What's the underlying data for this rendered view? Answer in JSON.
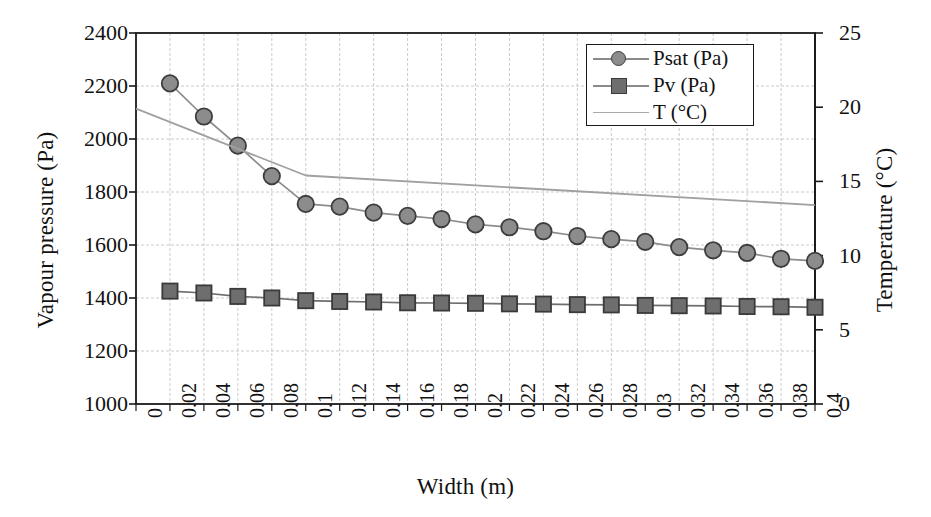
{
  "chart_data": {
    "type": "line",
    "title": "",
    "xlabel": "Width (m)",
    "ylabel": "Vapour pressure (Pa)",
    "y2label": "Temperature (°C)",
    "xlim": [
      0,
      0.4
    ],
    "ylim": [
      1000,
      2400
    ],
    "y2lim": [
      0,
      25
    ],
    "grid": true,
    "legend_position": "top-right",
    "categories": [
      0,
      0.02,
      0.04,
      0.06,
      0.08,
      0.1,
      0.12,
      0.14,
      0.16,
      0.18,
      0.2,
      0.22,
      0.24,
      0.26,
      0.28,
      0.3,
      0.32,
      0.34,
      0.36,
      0.38,
      0.4
    ],
    "xticklabels": [
      "0",
      "0.02",
      "0.04",
      "0.06",
      "0.08",
      "0.1",
      "0.12",
      "0.14",
      "0.16",
      "0.18",
      "0.2",
      "0.22",
      "0.24",
      "0.26",
      "0.28",
      "0.3",
      "0.32",
      "0.34",
      "0.36",
      "0.38",
      "0.4"
    ],
    "yticklabels": [
      "2400",
      "2200",
      "2000",
      "1800",
      "1600",
      "1400",
      "1200",
      "1000"
    ],
    "ytickvalues": [
      2400,
      2200,
      2000,
      1800,
      1600,
      1400,
      1200,
      1000
    ],
    "y2ticklabels": [
      "25",
      "20",
      "15",
      "10",
      "5",
      "0"
    ],
    "y2tickvalues": [
      25,
      20,
      15,
      10,
      5,
      0
    ],
    "series": [
      {
        "name": "Psat (Pa)",
        "axis": "left",
        "marker": "circle",
        "color": "#8c8c8c",
        "edge_color": "#3d3d3d",
        "x": [
          0.02,
          0.04,
          0.06,
          0.08,
          0.1,
          0.12,
          0.14,
          0.16,
          0.18,
          0.2,
          0.22,
          0.24,
          0.26,
          0.28,
          0.3,
          0.32,
          0.34,
          0.36,
          0.38,
          0.4
        ],
        "values": [
          2210,
          2085,
          1975,
          1860,
          1755,
          1745,
          1722,
          1710,
          1698,
          1678,
          1667,
          1652,
          1634,
          1622,
          1612,
          1592,
          1580,
          1570,
          1548,
          1540
        ]
      },
      {
        "name": "Pv (Pa)",
        "axis": "left",
        "marker": "square",
        "color": "#6e6e6e",
        "edge_color": "#3a3a3a",
        "x": [
          0.02,
          0.04,
          0.06,
          0.08,
          0.1,
          0.12,
          0.14,
          0.16,
          0.18,
          0.2,
          0.22,
          0.24,
          0.26,
          0.28,
          0.3,
          0.32,
          0.34,
          0.36,
          0.38,
          0.4
        ],
        "values": [
          1426,
          1419,
          1406,
          1400,
          1390,
          1387,
          1385,
          1382,
          1381,
          1380,
          1378,
          1377,
          1375,
          1374,
          1372,
          1371,
          1370,
          1368,
          1367,
          1365
        ]
      },
      {
        "name": "T (°C)",
        "axis": "right",
        "marker": "none",
        "color": "#a0a0a0",
        "x": [
          0,
          0.1,
          0.4
        ],
        "values": [
          19.9,
          15.4,
          13.4
        ]
      }
    ]
  },
  "legend": {
    "items": [
      {
        "label": "Psat (Pa)",
        "key": "circle-marker-line"
      },
      {
        "label": "Pv (Pa)",
        "key": "square-marker-line"
      },
      {
        "label": "T (°C)",
        "key": "plain-line"
      }
    ]
  },
  "axes": {
    "left_title": "Vapour pressure (Pa)",
    "right_title": "Temperature (°C)",
    "bottom_title": "Width (m)"
  }
}
